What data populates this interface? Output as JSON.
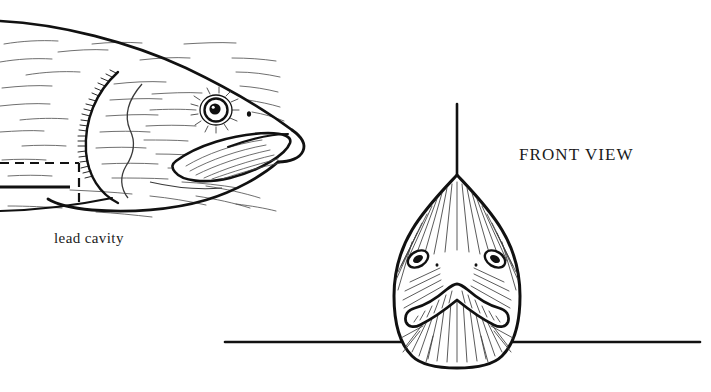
{
  "figure": {
    "background_color": "#ffffff",
    "ink_color": "#111111",
    "canvas": {
      "width": 711,
      "height": 392
    }
  },
  "labels": {
    "lead_cavity": "lead cavity",
    "front_view": "FRONT VIEW"
  },
  "views": {
    "side": {
      "name": "side-view-fish-head",
      "description": "Line drawing of a fish head in profile facing right, with eye, mouth, gill cover and stippled body shading",
      "features": {
        "eye": "eye",
        "nostril": "nostril",
        "mouth": "mouth",
        "gill_cover": "gill-cover",
        "body_outline": "body-outline"
      }
    },
    "front": {
      "name": "front-view-fish-head",
      "description": "Line drawing of the same fish head viewed head-on, teardrop silhouette with two eyes and a curved mouth",
      "features": {
        "left_eye": "left-eye",
        "right_eye": "right-eye",
        "mouth": "mouth",
        "head_outline": "head-outline",
        "center_axis_line": "center-axis-line",
        "baseline": "horizontal-baseline"
      }
    }
  },
  "annotations": {
    "lead_cavity_marker": {
      "name": "lead-cavity-dashed-outline",
      "style": "dashed",
      "leader_line": "lead-cavity-leader-line"
    }
  }
}
